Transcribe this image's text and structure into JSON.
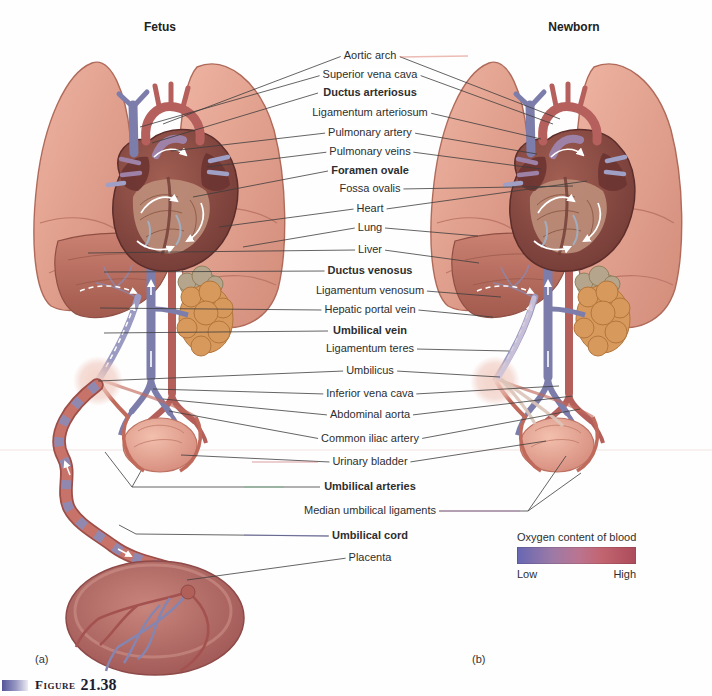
{
  "figure": {
    "word": "Figure",
    "number": "21.38"
  },
  "panels": {
    "left_title": "Fetus",
    "right_title": "Newborn",
    "left_caption": "(a)",
    "right_caption": "(b)"
  },
  "labels": [
    {
      "text": "Aortic arch",
      "bold": false
    },
    {
      "text": "Superior vena cava",
      "bold": false
    },
    {
      "text": "Ductus arteriosus",
      "bold": true
    },
    {
      "text": "Ligamentum arteriosum",
      "bold": false
    },
    {
      "text": "Pulmonary artery",
      "bold": false
    },
    {
      "text": "Pulmonary veins",
      "bold": false
    },
    {
      "text": "Foramen ovale",
      "bold": true
    },
    {
      "text": "Fossa ovalis",
      "bold": false
    },
    {
      "text": "Heart",
      "bold": false
    },
    {
      "text": "Lung",
      "bold": false
    },
    {
      "text": "Liver",
      "bold": false
    },
    {
      "text": "Ductus venosus",
      "bold": true
    },
    {
      "text": "Ligamentum venosum",
      "bold": false
    },
    {
      "text": "Hepatic portal vein",
      "bold": false
    },
    {
      "text": "Umbilical vein",
      "bold": true
    },
    {
      "text": "Ligamentum teres",
      "bold": false
    },
    {
      "text": "Umbilicus",
      "bold": false
    },
    {
      "text": "Inferior vena cava",
      "bold": false
    },
    {
      "text": "Abdominal aorta",
      "bold": false
    },
    {
      "text": "Common iliac artery",
      "bold": false
    },
    {
      "text": "Urinary bladder",
      "bold": false
    },
    {
      "text": "Umbilical arteries",
      "bold": true
    },
    {
      "text": "Median umbilical ligaments",
      "bold": false
    },
    {
      "text": "Umbilical cord",
      "bold": true
    },
    {
      "text": "Placenta",
      "bold": false
    }
  ],
  "legend": {
    "title": "Oxygen content of blood",
    "low_label": "Low",
    "high_label": "High",
    "gradient": [
      "#6868b2",
      "#9d7aa6",
      "#bb7490",
      "#c26470",
      "#ad4c5c"
    ]
  },
  "colors": {
    "leader_line": "#3d3d3d",
    "label_text": "#2e2e2e"
  }
}
